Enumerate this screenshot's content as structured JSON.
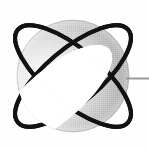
{
  "app": {
    "title": "Orbiting Sphere Logo",
    "canvas": {
      "width": 149,
      "height": 149
    },
    "background_color": "#fefefe"
  },
  "logo": {
    "name": "orbiting-sphere-logo",
    "alt_text": "Shaded grey sphere encircled by two crossed black orbital rings with a thin horizontal grey line extending to the right edge",
    "sphere": {
      "label": "sphere",
      "center_x": 73,
      "center_y": 76,
      "radius": 56,
      "highlight_x": 46,
      "highlight_y": 79,
      "highlight_color": "#ffffff",
      "midtone_color": "#c9c9c9",
      "shadow_color": "#7e7e7e",
      "edge_color": "#9a9a9a"
    },
    "rings": [
      {
        "label": "orbit-ring-front",
        "tilt_degrees": -40,
        "semi_major": 72,
        "semi_minor": 27,
        "stroke_color": "#111111",
        "stroke_width": 4
      },
      {
        "label": "orbit-ring-back",
        "tilt_degrees": 40,
        "semi_major": 72,
        "semi_minor": 27,
        "stroke_color": "#111111",
        "stroke_width": 4
      }
    ],
    "pointer_line": {
      "label": "pointer-line",
      "start_x": 126,
      "end_x": 149,
      "y": 78,
      "stroke_color": "#9b9b9b",
      "stroke_width": 2
    }
  }
}
